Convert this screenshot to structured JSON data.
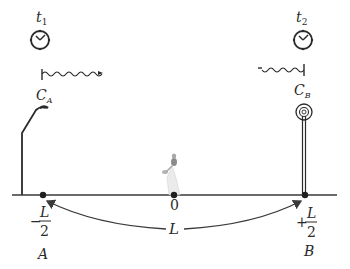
{
  "diagram": {
    "clock_left": {
      "label_main": "t",
      "label_sub": "1"
    },
    "clock_right": {
      "label_main": "t",
      "label_sub": "2"
    },
    "source_left": {
      "label_main": "C",
      "label_sub": "A"
    },
    "source_right": {
      "label_main": "C",
      "label_sub": "B"
    },
    "origin_label": "0",
    "point_A": {
      "sign": "−",
      "numerator": "L",
      "denominator": "2",
      "name": "A"
    },
    "point_B": {
      "sign": "+",
      "numerator": "L",
      "denominator": "2",
      "name": "B"
    },
    "distance_label": "L",
    "colors": {
      "line": "#3a3a3a",
      "text": "#2a2a2a",
      "background": "#ffffff"
    }
  }
}
